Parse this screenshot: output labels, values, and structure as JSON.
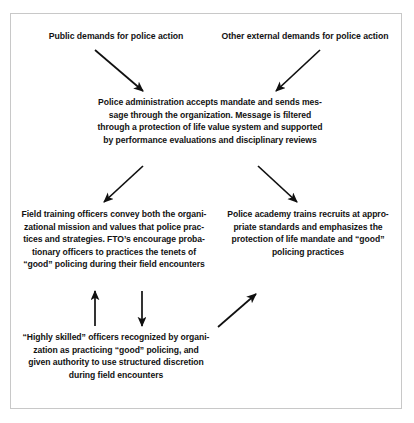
{
  "figure": {
    "background_color": "#ffffff",
    "frame_color": "#c8c8c8",
    "text_color": "#121212",
    "arrow_color": "#101010"
  },
  "nodes": {
    "public_demands": "Public demands for police action",
    "other_demands": "Other external demands for police action",
    "police_admin": "Police administration accepts mandate and sends mes-\nsage through the organization. Message is filtered\nthrough a protection of life value system and supported\nby performance evaluations and disciplinary reviews",
    "field_training": "Field training officers convey both the organi-\nzational mission and values that police prac-\ntices and strategies. FTO’s encourage proba-\ntionary officers to practices the tenets of\n“good” policing during their field encounters",
    "police_academy": "Police academy trains recruits at appro-\npriate standards and emphasizes the\nprotection of life mandate and “good”\npolicing practices",
    "highly_skilled": "“Highly skilled” officers recognized by organi-\nzation as practicing “good” policing, and\ngiven authority to use structured discretion\nduring field encounters"
  },
  "arrows": [
    {
      "name": "public-demands-to-admin",
      "direction": "down-right",
      "x1": 95,
      "y1": 50,
      "x2": 143,
      "y2": 91
    },
    {
      "name": "other-demands-to-admin",
      "direction": "down-left",
      "x1": 320,
      "y1": 50,
      "x2": 276,
      "y2": 91
    },
    {
      "name": "admin-to-field-training",
      "direction": "down-left",
      "x1": 143,
      "y1": 166,
      "x2": 104,
      "y2": 202
    },
    {
      "name": "admin-to-police-academy",
      "direction": "down-right",
      "x1": 258,
      "y1": 166,
      "x2": 297,
      "y2": 202
    },
    {
      "name": "highly-skilled-to-field-training",
      "direction": "up",
      "x1": 95,
      "y1": 325,
      "x2": 95,
      "y2": 291
    },
    {
      "name": "field-training-to-highly-skilled",
      "direction": "down",
      "x1": 142,
      "y1": 291,
      "x2": 142,
      "y2": 325
    },
    {
      "name": "highly-skilled-to-police-academy",
      "direction": "up-right",
      "x1": 218,
      "y1": 327,
      "x2": 256,
      "y2": 294
    }
  ]
}
